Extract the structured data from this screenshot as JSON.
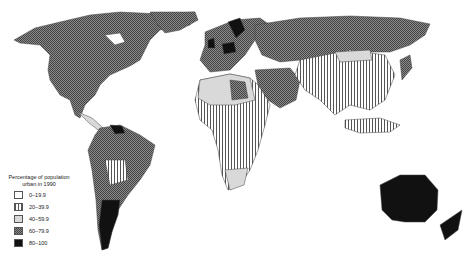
{
  "map": {
    "subject": "World map of urban population share",
    "legend": {
      "title_line1": "Percentage of population",
      "title_line2": "urban in 1990",
      "classes": [
        {
          "label": "0–19.9",
          "pattern": "white"
        },
        {
          "label": "20–39.9",
          "pattern": "vertical-stripes"
        },
        {
          "label": "40–59.9",
          "pattern": "light-gray"
        },
        {
          "label": "60–79.9",
          "pattern": "checkered-dark-gray"
        },
        {
          "label": "80–100",
          "pattern": "black"
        }
      ]
    },
    "colors": {
      "c0": "#ffffff",
      "c1_stripe": "#555555",
      "c2": "#d9d9d9",
      "c3": "#6e6e6e",
      "c4": "#111111",
      "border": "#444444"
    }
  }
}
